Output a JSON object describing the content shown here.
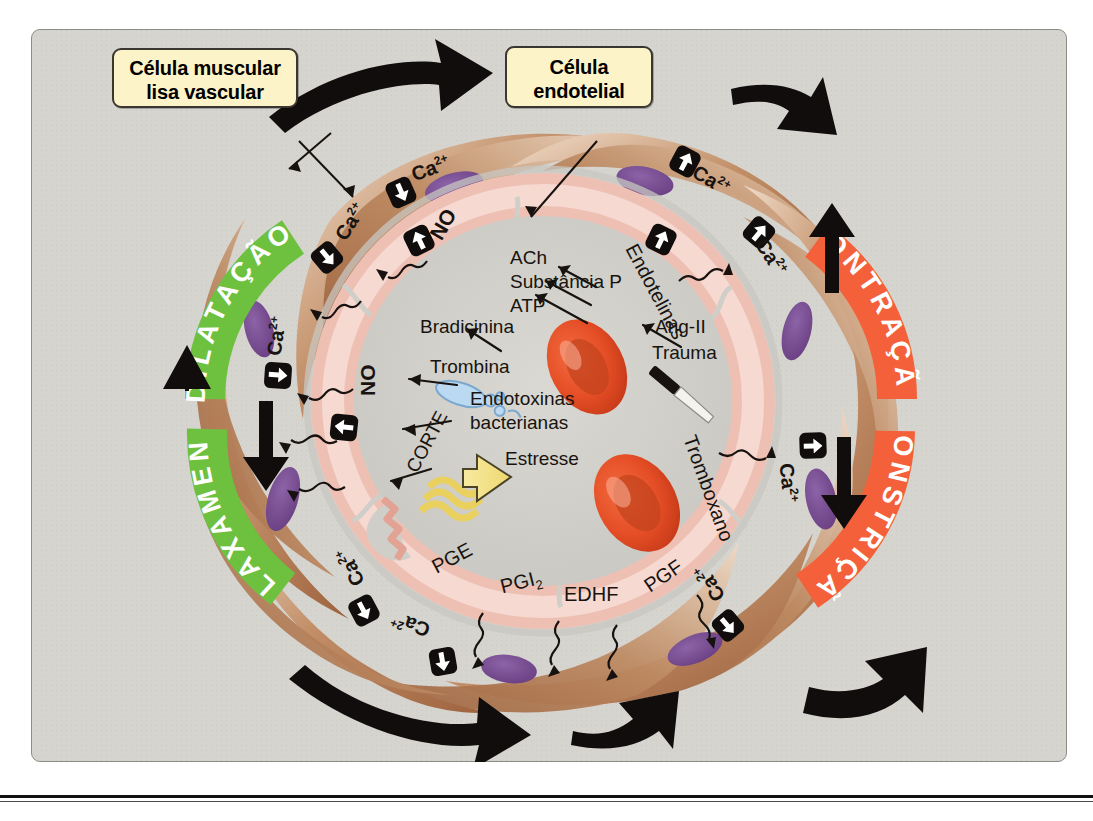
{
  "figure": {
    "background_color": "#d5d4cf"
  },
  "callouts": [
    {
      "name": "smooth-muscle-callout",
      "line1": "Célula muscular",
      "line2": "lisa vascular"
    },
    {
      "name": "endothelial-callout",
      "line1": "Célula",
      "line2": "endotelial"
    }
  ],
  "banners": [
    {
      "name": "dilatacao",
      "text": "DILATAÇÃO",
      "color": "#6dc13f",
      "side": "left"
    },
    {
      "name": "relaxamento",
      "text": "RELAXAMENTO",
      "color": "#6dc13f",
      "side": "left"
    },
    {
      "name": "contracao",
      "text": "CONTRAÇÃO",
      "color": "#f4603a",
      "side": "right"
    },
    {
      "name": "constricao",
      "text": "CONSTRIÇÃO",
      "color": "#f4603a",
      "side": "right"
    }
  ],
  "agonists": {
    "vasodilators": [
      "ACh",
      "Substância P",
      "ATP",
      "Bradicinina",
      "Trombina",
      "Endotoxinas bacterianas",
      "Estresse"
    ],
    "vasoconstrictors": [
      "Ang-II",
      "Trauma"
    ]
  },
  "mediators": {
    "dilator": [
      "NO",
      "PGE",
      "PGI",
      "EDHF"
    ],
    "constrictor": [
      "Endotelinas",
      "Tromboxano",
      "PGF"
    ]
  },
  "labels": {
    "ach": "ACh",
    "substancia_p": "Substância P",
    "atp": "ATP",
    "bradicinina": "Bradicinina",
    "trombina": "Trombina",
    "endotoxinas_1": "Endotoxinas",
    "endotoxinas_2": "bacterianas",
    "estresse": "Estresse",
    "corte": "CORTE",
    "no": "NO",
    "pge": "PGE",
    "pgi2": "PGI",
    "pgi2_sub": "2",
    "edhf": "EDHF",
    "pgf": "PGF",
    "endotelinas": "Endotelinas",
    "tromboxano": "Tromboxano",
    "ang_ii": "Ang-II",
    "trauma": "Trauma",
    "calcium": "Ca",
    "calcium_sup": "2+"
  },
  "calcium_markers": [
    {
      "name": "ca-up-top-right-outer",
      "direction": "up",
      "region": "contraction"
    },
    {
      "name": "ca-up-top-right-inner",
      "direction": "up",
      "region": "contraction"
    },
    {
      "name": "ca-up-right-mid",
      "direction": "up",
      "region": "constriction"
    },
    {
      "name": "ca-down-bottom-right",
      "direction": "down",
      "region": "constriction"
    },
    {
      "name": "ca-down-top-left-outer",
      "direction": "down",
      "region": "dilation"
    },
    {
      "name": "ca-down-top-left-inner",
      "direction": "down",
      "region": "dilation"
    },
    {
      "name": "ca-down-left-mid",
      "direction": "down",
      "region": "relaxation"
    },
    {
      "name": "ca-up-bottom-left-outer",
      "direction": "down",
      "region": "relaxation"
    },
    {
      "name": "ca-up-bottom-left-inner",
      "direction": "down",
      "region": "relaxation"
    }
  ],
  "mediator_markers": [
    {
      "name": "no-up-top",
      "direction": "up",
      "label": "NO"
    },
    {
      "name": "no-up-left",
      "direction": "up",
      "label": "NO"
    },
    {
      "name": "endotelinas-up",
      "direction": "up",
      "label": "Endotelinas"
    }
  ],
  "colors": {
    "green_banner": "#6dc13f",
    "red_banner": "#f4603a",
    "callout_fill": "#fdf3c8",
    "nucleus": "#7b4f96",
    "rbc": "#e8502a",
    "smooth_muscle": "#b5794f",
    "endothelium": "#f0bdb0",
    "lumen": "#cdccc6"
  }
}
